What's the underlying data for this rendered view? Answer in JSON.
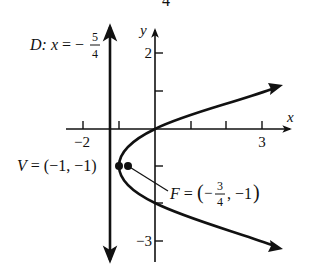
{
  "figure": {
    "top_fragment": "4",
    "axes": {
      "x_label": "x",
      "y_label": "y",
      "x_tick_labels": [
        {
          "value": -2,
          "text": "−2"
        },
        {
          "value": 3,
          "text": "3"
        }
      ],
      "y_tick_labels": [
        {
          "value": 2,
          "text": "2"
        },
        {
          "value": -3,
          "text": "−3"
        }
      ],
      "x_ticks": [
        -2,
        -1,
        1,
        2,
        3
      ],
      "y_ticks": [
        2,
        1,
        -1,
        -2,
        -3
      ]
    },
    "directrix": {
      "label_prefix": "D: ",
      "label_var": "x",
      "label_eq": " = −",
      "frac_num": "5",
      "frac_den": "4",
      "x": -1.25
    },
    "vertex": {
      "label": "V = (−1, −1)",
      "point": [
        -1,
        -1
      ]
    },
    "focus": {
      "label_prefix": "F = ",
      "label_open": "(−",
      "frac_num": "3",
      "frac_den": "4",
      "label_close": ", −1)",
      "point": [
        -0.75,
        -1
      ]
    },
    "parabola": {
      "equation": "(y + 1)^2 = x + 1",
      "opens": "right"
    },
    "colors": {
      "ink": "#111111",
      "background": "#ffffff"
    }
  }
}
